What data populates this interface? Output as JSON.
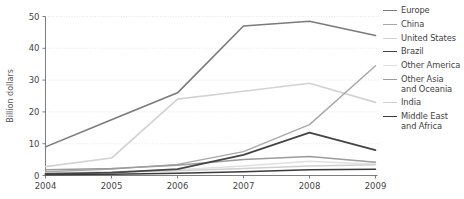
{
  "chart_data": {
    "type": "line",
    "title": "",
    "xlabel": "",
    "ylabel": "Billion dollars",
    "x": [
      2004,
      2005,
      2006,
      2007,
      2008,
      2009
    ],
    "xticklabels": [
      "2004",
      "2005",
      "2006",
      "2007",
      "2008",
      "2009"
    ],
    "yticklabels": [
      "0",
      "10",
      "20",
      "30",
      "40",
      "50"
    ],
    "yticks": [
      0,
      10,
      20,
      30,
      40,
      50
    ],
    "ylim": [
      0,
      50
    ],
    "xlim": [
      2004,
      2009
    ],
    "grid": "horizontal-dotted",
    "legend_position": "right",
    "series": [
      {
        "name": "Europe",
        "color": "#7a7a7a",
        "width": 1.6,
        "values": [
          9.0,
          17.5,
          26.0,
          47.0,
          48.5,
          44.0
        ]
      },
      {
        "name": "China",
        "color": "#a8a8a8",
        "width": 1.4,
        "values": [
          1.2,
          2.0,
          3.5,
          7.5,
          16.0,
          34.5
        ]
      },
      {
        "name": "United States",
        "color": "#d2d2d2",
        "width": 1.7,
        "values": [
          2.8,
          5.5,
          24.0,
          26.5,
          29.0,
          23.0
        ]
      },
      {
        "name": "Brazil",
        "color": "#444444",
        "width": 1.8,
        "values": [
          0.5,
          0.9,
          2.0,
          6.5,
          13.5,
          8.0
        ]
      },
      {
        "name": "Other America",
        "color": "#e0e0e0",
        "width": 1.5,
        "values": [
          0.8,
          1.2,
          1.8,
          3.0,
          4.5,
          3.5
        ]
      },
      {
        "name": "Other Asia\nand Oceania",
        "color": "#9b9b9b",
        "width": 1.5,
        "values": [
          1.8,
          2.2,
          3.2,
          5.0,
          6.0,
          4.2
        ]
      },
      {
        "name": "India",
        "color": "#cfcfcf",
        "width": 1.4,
        "values": [
          0.6,
          1.0,
          1.5,
          2.2,
          3.0,
          3.4
        ]
      },
      {
        "name": "Middle East\nand Africa",
        "color": "#3a3a3a",
        "width": 1.5,
        "values": [
          0.2,
          0.4,
          0.7,
          1.2,
          1.8,
          2.0
        ]
      }
    ]
  },
  "axes": {
    "ylabel": "Billion dollars"
  }
}
